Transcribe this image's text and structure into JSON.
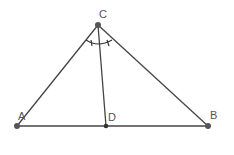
{
  "diagram": {
    "points": {
      "A": {
        "label": "A",
        "x": 17,
        "y": 126
      },
      "B": {
        "label": "B",
        "x": 208,
        "y": 126
      },
      "C": {
        "label": "C",
        "x": 98,
        "y": 25
      },
      "D": {
        "label": "D",
        "x": 106,
        "y": 126
      }
    },
    "segments": [
      "AB",
      "AC",
      "BC",
      "CD"
    ],
    "annotations": "Equal angle marks at C: angle ACD = angle DCB",
    "colors": {
      "line": "#444444",
      "point": "#555555",
      "label": "#555555"
    }
  }
}
